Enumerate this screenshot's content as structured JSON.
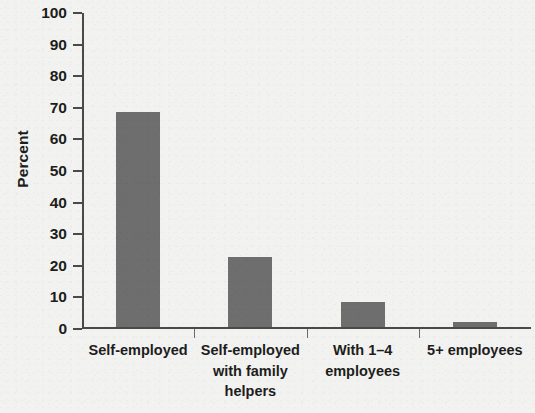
{
  "chart_data": {
    "type": "bar",
    "title": "",
    "subtitle": "",
    "xlabel": "",
    "ylabel": "Percent",
    "categories": [
      "Self-employed",
      "Self-employed with family helpers",
      "With 1–4 employees",
      "5+ employees"
    ],
    "category_lines": [
      [
        "Self-employed"
      ],
      [
        "Self-employed",
        "with family",
        "helpers"
      ],
      [
        "With 1–4",
        "employees"
      ],
      [
        "5+ employees"
      ]
    ],
    "values": [
      68,
      22,
      8,
      1.5
    ],
    "value_labels": [
      "68",
      "22",
      "8",
      "1.5"
    ],
    "ylim": [
      0,
      100
    ],
    "ytick_values": [
      0,
      10,
      20,
      30,
      40,
      50,
      60,
      70,
      80,
      90,
      100
    ],
    "ytick_labels": [
      "0",
      "10",
      "20",
      "30",
      "40",
      "50",
      "60",
      "70",
      "80",
      "90",
      "100"
    ],
    "grid": false,
    "legend": null,
    "legend_position": "none",
    "bar_color": "#6e6e6e",
    "axis_color": "#4a4a4a",
    "background_color": "#f2f2f0",
    "text_color": "#1d1d1d"
  }
}
